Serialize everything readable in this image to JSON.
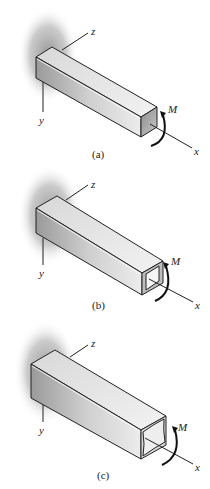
{
  "figure": {
    "panels": [
      {
        "id": "a",
        "caption": "(a)",
        "axes": {
          "x": "x",
          "y": "y",
          "z": "z"
        },
        "moment": "M",
        "section": "solid-square"
      },
      {
        "id": "b",
        "caption": "(b)",
        "axes": {
          "x": "x",
          "y": "y",
          "z": "z"
        },
        "moment": "M",
        "section": "hollow-square-thick"
      },
      {
        "id": "c",
        "caption": "(c)",
        "axes": {
          "x": "x",
          "y": "y",
          "z": "z"
        },
        "moment": "M",
        "section": "hollow-square-thin"
      }
    ]
  }
}
